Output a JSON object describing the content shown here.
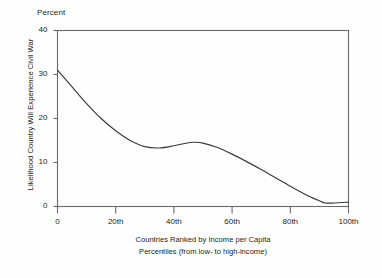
{
  "chart_data": {
    "type": "line",
    "title": "",
    "unit_label": "Percent",
    "ylabel": "Likelihood Country Will Experience Civil War",
    "xlabel_lines": [
      "Countries Ranked by Income per Capita",
      "Percentiles (from low- to high-income)"
    ],
    "xlabel": "Countries Ranked by Income per Capita Percentiles (from low- to high-income)",
    "x_tick_labels": [
      "0",
      "20th",
      "40th",
      "60th",
      "80th",
      "100th"
    ],
    "x_tick_values": [
      0,
      20,
      40,
      60,
      80,
      100
    ],
    "y_tick_labels": [
      "0",
      "10",
      "20",
      "30",
      "40"
    ],
    "y_tick_values": [
      0,
      10,
      20,
      30,
      40
    ],
    "xlim": [
      0,
      100
    ],
    "ylim": [
      0,
      40
    ],
    "grid": false,
    "legend": false,
    "line_color": "#3a3a3a",
    "frame_color": "#6b6b6b",
    "background_color": "#fefefe",
    "x": [
      0,
      5,
      10,
      15,
      20,
      25,
      30,
      35,
      40,
      45,
      47,
      50,
      55,
      60,
      65,
      70,
      75,
      80,
      85,
      90,
      92,
      95,
      100
    ],
    "values": [
      31.0,
      27.2,
      23.4,
      20.0,
      17.2,
      15.0,
      13.6,
      13.3,
      13.8,
      14.5,
      14.6,
      14.4,
      13.4,
      11.9,
      10.2,
      8.4,
      6.5,
      4.6,
      2.8,
      1.3,
      0.8,
      0.8,
      1.0
    ],
    "series": [
      {
        "name": "Likelihood Country Will Experience Civil War",
        "values": [
          31.0,
          27.2,
          23.4,
          20.0,
          17.2,
          15.0,
          13.6,
          13.3,
          13.8,
          14.5,
          14.6,
          14.4,
          13.4,
          11.9,
          10.2,
          8.4,
          6.5,
          4.6,
          2.8,
          1.3,
          0.8,
          0.8,
          1.0
        ]
      }
    ],
    "annotations": []
  }
}
